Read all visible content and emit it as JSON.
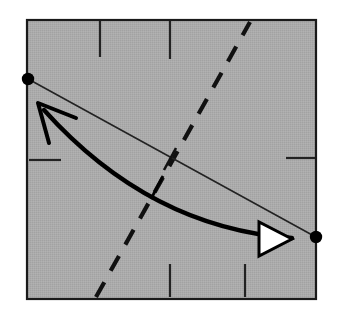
{
  "figure": {
    "title": "Curved arrow and straight chord between two boundary points inside a shaded square",
    "type": "geometric-diagram",
    "canvas": {
      "width": 340,
      "height": 318,
      "background": "#ffffff"
    }
  },
  "colors": {
    "page_background": "#ffffff",
    "square_fill": "#a9a9a9",
    "square_stroke": "#1a1a1a",
    "line_stroke": "#222222",
    "curve_stroke": "#000000",
    "dash_stroke": "#111111",
    "tick_stroke": "#222222",
    "dot_fill": "#000000",
    "arrowhead_fill": "#ffffff",
    "arrowhead_stroke": "#000000"
  },
  "square": {
    "name": "shaded-square",
    "x": 27,
    "y": 20,
    "width": 289,
    "height": 279,
    "fill": "#a9a9a9",
    "stroke_width": 2.2
  },
  "points": [
    {
      "label": "left-endpoint",
      "x": 28,
      "y": 79,
      "radius": 6.2
    },
    {
      "label": "right-endpoint",
      "x": 316,
      "y": 237,
      "radius": 6.2
    }
  ],
  "chord": {
    "name": "straight-chord",
    "x1": 30,
    "y1": 80,
    "x2": 314,
    "y2": 236,
    "stroke_width": 1.6
  },
  "curve": {
    "name": "curved-arc",
    "start_x": 44,
    "start_y": 110,
    "control_x": 150,
    "control_y": 228,
    "end_x": 292,
    "end_y": 238,
    "stroke_width": 4.4
  },
  "arrow_open": {
    "name": "open-v-arrowhead",
    "tip_x": 38,
    "tip_y": 103,
    "barb_a_x": 76,
    "barb_a_y": 118,
    "barb_b_x": 49,
    "barb_b_y": 143,
    "stroke_width": 4.0
  },
  "arrow_triangle": {
    "name": "filled-triangle-arrowhead",
    "p1_x": 259,
    "p1_y": 222,
    "p2_x": 259,
    "p2_y": 256,
    "p3_x": 292,
    "p3_y": 239,
    "stroke_width": 3.0
  },
  "dashed_line": {
    "name": "dashed-diagonal",
    "x1": 96,
    "y1": 297,
    "x2": 250,
    "y2": 22,
    "stroke_width": 4.2,
    "dash_pattern": "17 13"
  },
  "border_ticks": [
    {
      "name": "tick-top-left",
      "edge": "top",
      "x1": 100,
      "y1": 21,
      "x2": 100,
      "y2": 57
    },
    {
      "name": "tick-top-right",
      "edge": "top",
      "x1": 170,
      "y1": 21,
      "x2": 170,
      "y2": 59
    },
    {
      "name": "tick-left-middle",
      "edge": "left",
      "x1": 29,
      "y1": 160,
      "x2": 61,
      "y2": 160
    },
    {
      "name": "tick-right-middle",
      "edge": "right",
      "x1": 286,
      "y1": 158,
      "x2": 315,
      "y2": 158
    },
    {
      "name": "tick-bottom-left",
      "edge": "bottom",
      "x1": 170,
      "y1": 264,
      "x2": 170,
      "y2": 297
    },
    {
      "name": "tick-bottom-right",
      "edge": "bottom",
      "x1": 245,
      "y1": 264,
      "x2": 245,
      "y2": 297
    }
  ],
  "cross_ticks": [
    {
      "name": "tick-on-chord",
      "x1": 176,
      "y1": 148,
      "x2": 164,
      "y2": 170,
      "stroke_width": 2.6
    },
    {
      "name": "tick-on-curve",
      "x1": 163,
      "y1": 176,
      "x2": 151,
      "y2": 199,
      "stroke_width": 2.8
    }
  ]
}
